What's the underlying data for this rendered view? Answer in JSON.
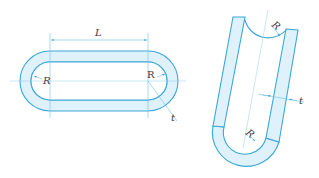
{
  "diagram": {
    "colors": {
      "outline": "#3aa8d8",
      "fill": "#dff1fa",
      "dim_line": "#6cc0e4",
      "text": "#3a3a3a"
    },
    "left_figure": {
      "description": "Obround (racetrack) ring shape, top view",
      "labels": {
        "length": "L",
        "radius_left": "R",
        "radius_right": "R",
        "thickness": "t"
      }
    },
    "right_figure": {
      "description": "U-shaped bent section, tilted",
      "labels": {
        "radius_top": "R",
        "radius_bottom": "R",
        "thickness": "t"
      }
    }
  }
}
